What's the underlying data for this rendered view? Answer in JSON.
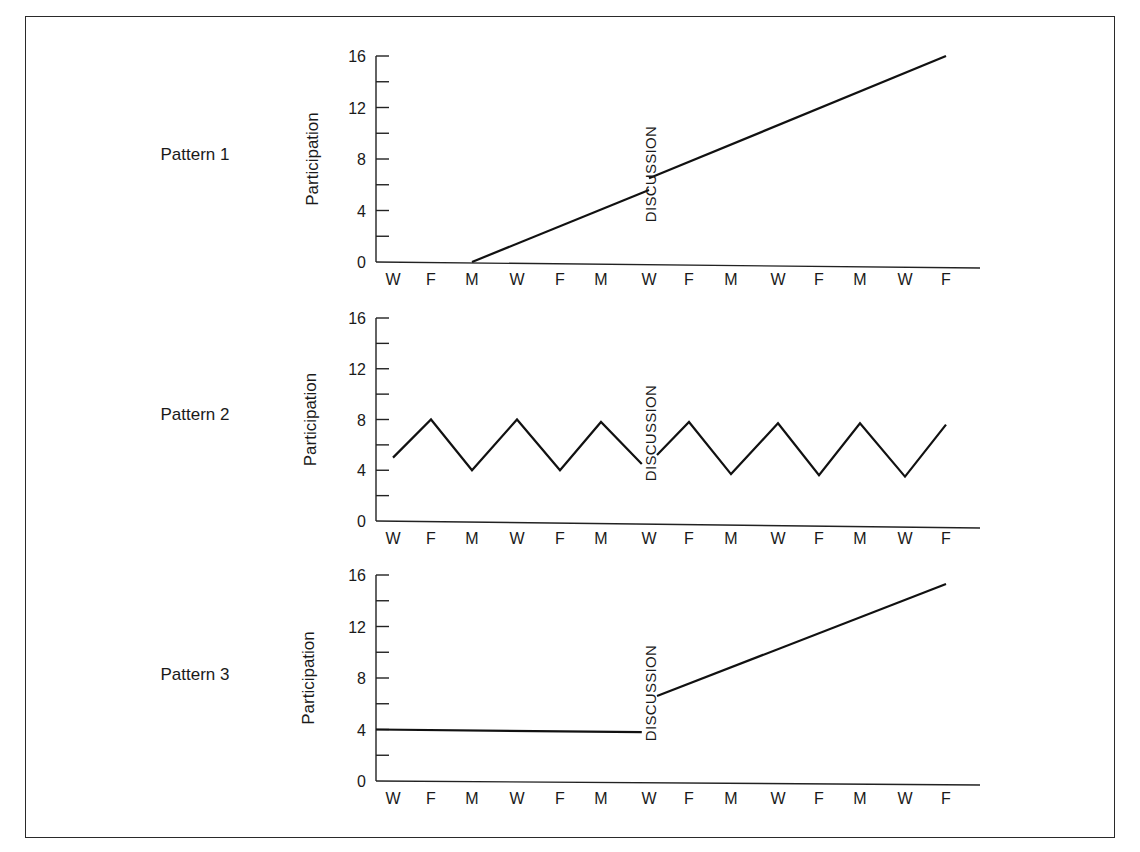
{
  "chart_data": [
    {
      "type": "line",
      "title": "Pattern 1",
      "ylabel": "Participation",
      "xlabel": "",
      "ylim": [
        0,
        16
      ],
      "yticks": [
        0,
        4,
        8,
        12,
        16
      ],
      "categories": [
        "W",
        "F",
        "M",
        "W",
        "F",
        "M",
        "W",
        "F",
        "M",
        "W",
        "F",
        "M",
        "W",
        "F"
      ],
      "annotation": {
        "text": "DISCUSSION",
        "at_index": 6
      },
      "series": [
        {
          "name": "before",
          "points": [
            [
              2,
              0
            ],
            [
              6,
              5.6
            ]
          ]
        },
        {
          "name": "after",
          "points": [
            [
              6,
              6.5
            ],
            [
              13,
              16
            ]
          ]
        }
      ]
    },
    {
      "type": "line",
      "title": "Pattern 2",
      "ylabel": "Participation",
      "xlabel": "",
      "ylim": [
        0,
        16
      ],
      "yticks": [
        0,
        4,
        8,
        12,
        16
      ],
      "categories": [
        "W",
        "F",
        "M",
        "W",
        "F",
        "M",
        "W",
        "F",
        "M",
        "W",
        "F",
        "M",
        "W",
        "F"
      ],
      "annotation": {
        "text": "DISCUSSION",
        "at_index": 6
      },
      "series": [
        {
          "name": "before",
          "points": [
            [
              0,
              5
            ],
            [
              1,
              8
            ],
            [
              2,
              4
            ],
            [
              3,
              8
            ],
            [
              4,
              4
            ],
            [
              5,
              7.8
            ],
            [
              5.85,
              4.5
            ]
          ]
        },
        {
          "name": "after",
          "points": [
            [
              6.2,
              5.2
            ],
            [
              7,
              7.8
            ],
            [
              8,
              3.7
            ],
            [
              9,
              7.7
            ],
            [
              10,
              3.6
            ],
            [
              11,
              7.7
            ],
            [
              12,
              3.5
            ],
            [
              13,
              7.6
            ]
          ]
        }
      ]
    },
    {
      "type": "line",
      "title": "Pattern 3",
      "ylabel": "Participation",
      "xlabel": "",
      "ylim": [
        0,
        16
      ],
      "yticks": [
        0,
        4,
        8,
        12,
        16
      ],
      "categories": [
        "W",
        "F",
        "M",
        "W",
        "F",
        "M",
        "W",
        "F",
        "M",
        "W",
        "F",
        "M",
        "W",
        "F"
      ],
      "annotation": {
        "text": "DISCUSSION",
        "at_index": 6
      },
      "series": [
        {
          "name": "before",
          "points": [
            [
              -0.4,
              4
            ],
            [
              5.85,
              3.8
            ]
          ]
        },
        {
          "name": "after",
          "points": [
            [
              6.2,
              6.6
            ],
            [
              13,
              15.3
            ]
          ]
        }
      ]
    }
  ],
  "layout": {
    "panels": [
      {
        "top": 56,
        "bottom": 262,
        "label_y": 160,
        "ylabel_x": 318
      },
      {
        "top": 318,
        "bottom": 521,
        "label_y": 420,
        "ylabel_x": 316
      },
      {
        "top": 575,
        "bottom": 781,
        "label_y": 680,
        "ylabel_x": 314
      }
    ],
    "axis_left": 376,
    "axis_right": 980,
    "x_positions": [
      393,
      431,
      472,
      517,
      560,
      601,
      649,
      689,
      731,
      778,
      819,
      860,
      905,
      946
    ],
    "pattern_label_x": 195,
    "discussion_x": 652
  }
}
